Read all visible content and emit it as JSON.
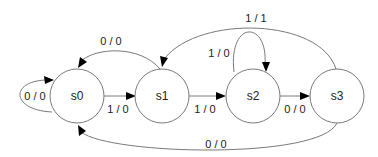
{
  "diagram": {
    "type": "finite-state-machine",
    "states": [
      {
        "id": "s0",
        "label": "s0"
      },
      {
        "id": "s1",
        "label": "s1"
      },
      {
        "id": "s2",
        "label": "s2"
      },
      {
        "id": "s3",
        "label": "s3"
      }
    ],
    "transitions": [
      {
        "from": "s0",
        "to": "s0",
        "label": "0 / 0"
      },
      {
        "from": "s0",
        "to": "s1",
        "label": "1 / 0"
      },
      {
        "from": "s1",
        "to": "s0",
        "label": "0 / 0"
      },
      {
        "from": "s1",
        "to": "s2",
        "label": "1 / 0"
      },
      {
        "from": "s2",
        "to": "s2",
        "label": "1 / 0"
      },
      {
        "from": "s2",
        "to": "s3",
        "label": "0 / 0"
      },
      {
        "from": "s3",
        "to": "s1",
        "label": "1 / 1"
      },
      {
        "from": "s3",
        "to": "s0",
        "label": "0 / 0"
      }
    ]
  }
}
